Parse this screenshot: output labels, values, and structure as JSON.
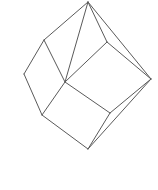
{
  "figure": {
    "shape_name": "cube",
    "projection": "oblique corner view",
    "canvas": {
      "width": 158,
      "height": 190,
      "background_color": "#ffffff"
    },
    "style": {
      "stroke_color": "#5a5a5a",
      "stroke_width": 1,
      "fill": "none"
    },
    "vertex_count": 8,
    "edge_count": 12,
    "face_count": 6,
    "vertices": [
      {
        "id": "top",
        "label": "A",
        "x": 88,
        "y": 2
      },
      {
        "id": "upper-left",
        "label": "B",
        "x": 44,
        "y": 40
      },
      {
        "id": "upper-right",
        "label": "C",
        "x": 107,
        "y": 42
      },
      {
        "id": "left",
        "label": "D",
        "x": 24,
        "y": 74
      },
      {
        "id": "center-near",
        "label": "E",
        "x": 65,
        "y": 82
      },
      {
        "id": "right",
        "label": "F",
        "x": 151,
        "y": 79
      },
      {
        "id": "lower-left",
        "label": "G",
        "x": 42,
        "y": 115
      },
      {
        "id": "lower-right",
        "label": "H",
        "x": 110,
        "y": 113
      },
      {
        "id": "bottom",
        "label": "I",
        "x": 88,
        "y": 149
      }
    ],
    "edges": [
      {
        "id": "edge-top-upperleft",
        "from": "top",
        "to": "upper-left",
        "path": "M88,2 L44,40"
      },
      {
        "id": "edge-top-upperright",
        "from": "top",
        "to": "upper-right",
        "path": "M88,2 L107,42"
      },
      {
        "id": "edge-top-centernear",
        "from": "top",
        "to": "center-near",
        "path": "M88,2 L65,82"
      },
      {
        "id": "edge-top-right",
        "from": "top",
        "to": "right",
        "path": "M88,2 L151,79"
      },
      {
        "id": "edge-upperleft-left",
        "from": "upper-left",
        "to": "left",
        "path": "M44,40 L24,74"
      },
      {
        "id": "edge-upperleft-centernear",
        "from": "upper-left",
        "to": "center-near",
        "path": "M44,40 L65,82"
      },
      {
        "id": "edge-upperright-right",
        "from": "upper-right",
        "to": "right",
        "path": "M107,42 L151,79"
      },
      {
        "id": "edge-upperright-centernear",
        "from": "upper-right",
        "to": "center-near",
        "path": "M107,42 L65,82"
      },
      {
        "id": "edge-left-lowerleft",
        "from": "left",
        "to": "lower-left",
        "path": "M24,74 L42,115"
      },
      {
        "id": "edge-centernear-lowerleft",
        "from": "center-near",
        "to": "lower-left",
        "path": "M65,82 L42,115"
      },
      {
        "id": "edge-centernear-lowerright",
        "from": "center-near",
        "to": "lower-right",
        "path": "M65,82 L110,113"
      },
      {
        "id": "edge-right-lowerright",
        "from": "right",
        "to": "lower-right",
        "path": "M151,79 L110,113"
      },
      {
        "id": "edge-lowerleft-bottom",
        "from": "lower-left",
        "to": "bottom",
        "path": "M42,115 L88,149"
      },
      {
        "id": "edge-lowerright-bottom",
        "from": "lower-right",
        "to": "bottom",
        "path": "M110,113 L88,149"
      },
      {
        "id": "edge-right-bottom",
        "from": "right",
        "to": "bottom",
        "path": "M151,79 L88,149"
      }
    ]
  }
}
